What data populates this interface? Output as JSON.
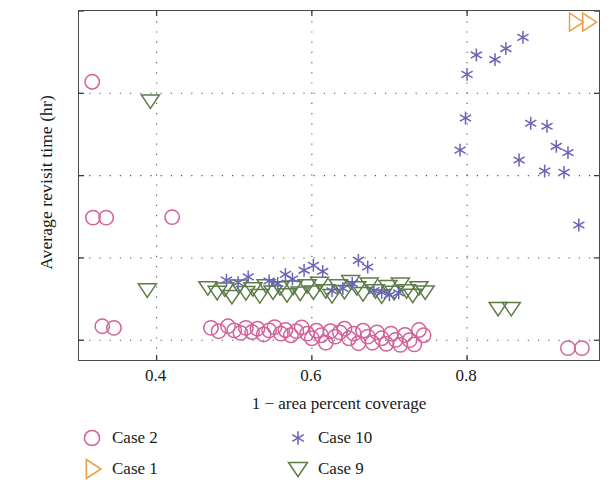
{
  "chart_data": {
    "type": "scatter",
    "title": "",
    "xlabel": "1 − area percent coverage",
    "ylabel": "Average revisit time (hr)",
    "xlim": [
      0.3,
      0.97
    ],
    "ylim": [
      0.88,
      3.0
    ],
    "xticks": [
      0.4,
      0.6,
      0.8
    ],
    "xtick_labels": [
      "0.4",
      "0.6",
      "0.8"
    ],
    "yticks": [
      1,
      1.5,
      2,
      2.5,
      3
    ],
    "ytick_labels": [
      "1",
      "1.5",
      "2",
      "2.5",
      "3"
    ],
    "grid": "dotted",
    "legend_position": "below-axes",
    "series": [
      {
        "name": "Case 2",
        "marker": "circle",
        "color": "#d2639b",
        "points": [
          [
            0.317,
            2.57
          ],
          [
            0.318,
            1.745
          ],
          [
            0.335,
            1.745
          ],
          [
            0.42,
            1.748
          ],
          [
            0.33,
            1.085
          ],
          [
            0.345,
            1.075
          ],
          [
            0.47,
            1.075
          ],
          [
            0.48,
            1.055
          ],
          [
            0.492,
            1.085
          ],
          [
            0.5,
            1.06
          ],
          [
            0.508,
            1.045
          ],
          [
            0.515,
            1.075
          ],
          [
            0.523,
            1.05
          ],
          [
            0.53,
            1.07
          ],
          [
            0.538,
            1.035
          ],
          [
            0.545,
            1.06
          ],
          [
            0.552,
            1.08
          ],
          [
            0.56,
            1.04
          ],
          [
            0.566,
            1.062
          ],
          [
            0.573,
            1.03
          ],
          [
            0.58,
            1.055
          ],
          [
            0.587,
            1.078
          ],
          [
            0.594,
            1.04
          ],
          [
            0.6,
            1.012
          ],
          [
            0.606,
            1.058
          ],
          [
            0.612,
            1.03
          ],
          [
            0.618,
            0.985
          ],
          [
            0.624,
            1.055
          ],
          [
            0.63,
            1.022
          ],
          [
            0.636,
            1.048
          ],
          [
            0.642,
            1.07
          ],
          [
            0.648,
            1.012
          ],
          [
            0.654,
            1.04
          ],
          [
            0.66,
            0.982
          ],
          [
            0.666,
            1.058
          ],
          [
            0.672,
            1.022
          ],
          [
            0.678,
            0.985
          ],
          [
            0.684,
            1.048
          ],
          [
            0.69,
            1.012
          ],
          [
            0.696,
            0.978
          ],
          [
            0.702,
            1.04
          ],
          [
            0.708,
            1.002
          ],
          [
            0.714,
            0.972
          ],
          [
            0.72,
            1.032
          ],
          [
            0.726,
            1.0
          ],
          [
            0.732,
            0.975
          ],
          [
            0.738,
            1.062
          ],
          [
            0.744,
            1.03
          ],
          [
            0.93,
            0.952
          ],
          [
            0.948,
            0.952
          ]
        ]
      },
      {
        "name": "Case 1",
        "marker": "triangle-right",
        "color": "#e8a04c",
        "points": [
          [
            0.939,
            2.932
          ],
          [
            0.956,
            2.932
          ]
        ]
      },
      {
        "name": "Case 10",
        "marker": "asterisk",
        "color": "#6a63b8",
        "points": [
          [
            0.8,
            2.615
          ],
          [
            0.812,
            2.733
          ],
          [
            0.798,
            2.35
          ],
          [
            0.85,
            2.772
          ],
          [
            0.872,
            2.84
          ],
          [
            0.836,
            2.705
          ],
          [
            0.791,
            2.155
          ],
          [
            0.882,
            2.318
          ],
          [
            0.903,
            2.3
          ],
          [
            0.867,
            2.095
          ],
          [
            0.915,
            2.178
          ],
          [
            0.93,
            2.14
          ],
          [
            0.9,
            2.028
          ],
          [
            0.925,
            2.02
          ],
          [
            0.944,
            1.7
          ],
          [
            0.49,
            1.365
          ],
          [
            0.505,
            1.35
          ],
          [
            0.518,
            1.385
          ],
          [
            0.545,
            1.36
          ],
          [
            0.556,
            1.345
          ],
          [
            0.566,
            1.4
          ],
          [
            0.575,
            1.372
          ],
          [
            0.59,
            1.425
          ],
          [
            0.602,
            1.455
          ],
          [
            0.614,
            1.418
          ],
          [
            0.626,
            1.3
          ],
          [
            0.64,
            1.315
          ],
          [
            0.652,
            1.345
          ],
          [
            0.66,
            1.485
          ],
          [
            0.672,
            1.445
          ],
          [
            0.68,
            1.302
          ],
          [
            0.69,
            1.29
          ],
          [
            0.7,
            1.275
          ],
          [
            0.712,
            1.288
          ]
        ]
      },
      {
        "name": "Case 9",
        "marker": "triangle-down",
        "color": "#5e7d48",
        "points": [
          [
            0.392,
            2.452
          ],
          [
            0.388,
            1.305
          ],
          [
            0.466,
            1.318
          ],
          [
            0.478,
            1.29
          ],
          [
            0.488,
            1.31
          ],
          [
            0.497,
            1.265
          ],
          [
            0.506,
            1.328
          ],
          [
            0.515,
            1.288
          ],
          [
            0.524,
            1.312
          ],
          [
            0.533,
            1.27
          ],
          [
            0.541,
            1.33
          ],
          [
            0.55,
            1.292
          ],
          [
            0.559,
            1.318
          ],
          [
            0.568,
            1.275
          ],
          [
            0.576,
            1.322
          ],
          [
            0.585,
            1.285
          ],
          [
            0.594,
            1.33
          ],
          [
            0.602,
            1.292
          ],
          [
            0.61,
            1.345
          ],
          [
            0.618,
            1.3
          ],
          [
            0.626,
            1.27
          ],
          [
            0.634,
            1.33
          ],
          [
            0.642,
            1.295
          ],
          [
            0.65,
            1.355
          ],
          [
            0.658,
            1.318
          ],
          [
            0.666,
            1.282
          ],
          [
            0.674,
            1.34
          ],
          [
            0.682,
            1.3
          ],
          [
            0.69,
            1.268
          ],
          [
            0.698,
            1.325
          ],
          [
            0.706,
            1.29
          ],
          [
            0.714,
            1.34
          ],
          [
            0.722,
            1.3
          ],
          [
            0.73,
            1.272
          ],
          [
            0.738,
            1.318
          ],
          [
            0.746,
            1.292
          ],
          [
            0.84,
            1.192
          ],
          [
            0.857,
            1.192
          ]
        ]
      }
    ]
  },
  "legend": {
    "entries": [
      {
        "label": "Case 2",
        "marker": "circle",
        "color": "#d2639b"
      },
      {
        "label": "Case 1",
        "marker": "triangle-right",
        "color": "#e8a04c"
      },
      {
        "label": "Case 10",
        "marker": "asterisk",
        "color": "#6a63b8"
      },
      {
        "label": "Case 9",
        "marker": "triangle-down",
        "color": "#5e7d48"
      }
    ]
  }
}
